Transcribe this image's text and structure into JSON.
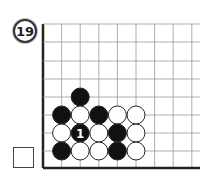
{
  "problem": {
    "number": "19",
    "answer_checkbox_checked": false
  },
  "board": {
    "columns": 9,
    "rows": 9,
    "edges": [
      "left",
      "bottom"
    ],
    "stones": [
      {
        "col": 2,
        "row": 4,
        "color": "black",
        "label": ""
      },
      {
        "col": 1,
        "row": 3,
        "color": "black",
        "label": ""
      },
      {
        "col": 2,
        "row": 3,
        "color": "white",
        "label": ""
      },
      {
        "col": 3,
        "row": 3,
        "color": "black",
        "label": ""
      },
      {
        "col": 4,
        "row": 3,
        "color": "white",
        "label": ""
      },
      {
        "col": 5,
        "row": 3,
        "color": "white",
        "label": ""
      },
      {
        "col": 1,
        "row": 2,
        "color": "white",
        "label": ""
      },
      {
        "col": 2,
        "row": 2,
        "color": "black",
        "label": "1"
      },
      {
        "col": 3,
        "row": 2,
        "color": "white",
        "label": ""
      },
      {
        "col": 4,
        "row": 2,
        "color": "black",
        "label": ""
      },
      {
        "col": 5,
        "row": 2,
        "color": "white",
        "label": ""
      },
      {
        "col": 1,
        "row": 1,
        "color": "black",
        "label": ""
      },
      {
        "col": 2,
        "row": 1,
        "color": "white",
        "label": ""
      },
      {
        "col": 3,
        "row": 1,
        "color": "white",
        "label": ""
      },
      {
        "col": 4,
        "row": 1,
        "color": "black",
        "label": ""
      },
      {
        "col": 5,
        "row": 1,
        "color": "white",
        "label": ""
      }
    ]
  }
}
